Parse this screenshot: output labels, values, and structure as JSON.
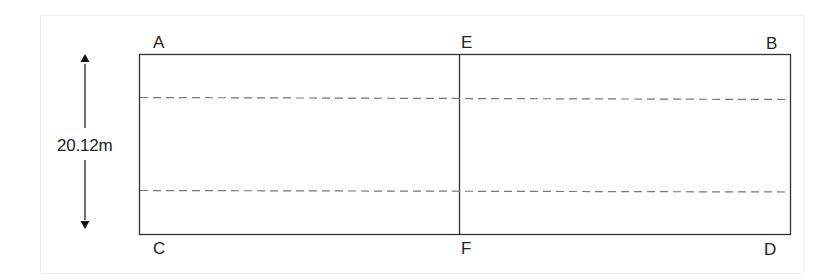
{
  "diagram": {
    "title": "",
    "points": {
      "A": "A",
      "B": "B",
      "C": "C",
      "D": "D",
      "E": "E",
      "F": "F"
    },
    "dimension": {
      "label": "20.12m",
      "orientation": "vertical"
    },
    "rectangle": {
      "corners": [
        "A",
        "B",
        "D",
        "C"
      ]
    },
    "divider": {
      "from": "E",
      "to": "F",
      "style": "solid"
    },
    "dashed_lines": [
      {
        "position": "upper",
        "style": "dashed"
      },
      {
        "position": "lower",
        "style": "dashed"
      }
    ],
    "colors": {
      "line": "#333333",
      "dashed": "#777777",
      "frame": "#f0f0f0",
      "text": "#222222"
    }
  }
}
